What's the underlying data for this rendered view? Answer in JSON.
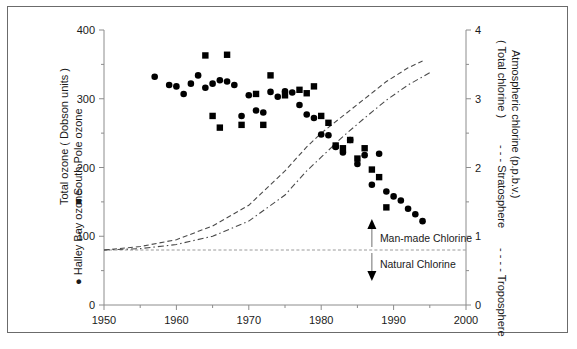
{
  "figure": {
    "background_color": "#ffffff",
    "frame_color": "#6b6b6b",
    "marker_color": "#000000",
    "curve_color": "#4a4a4a",
    "axis_color": "#8c8c8c"
  },
  "left_axis": {
    "title": "Total ozone ( Dobson units )",
    "legend_square": "South Pole ozone",
    "legend_circle": "Halley Bay ozone",
    "square_glyph": "■",
    "circle_glyph": "●",
    "ticks": [
      "0",
      "100",
      "200",
      "300",
      "400"
    ],
    "range": [
      0,
      400
    ]
  },
  "right_axis": {
    "title": "Atmospheric chlorine (p.p.b.v.)",
    "legend_total": "( Total chlorine )",
    "legend_strat": "- - -  Stratosphere",
    "legend_trop": "- - - -  Troposphere",
    "ticks": [
      "0",
      "1",
      "2",
      "3",
      "4"
    ],
    "range": [
      0,
      4
    ]
  },
  "x_axis": {
    "ticks": [
      "1950",
      "1960",
      "1970",
      "1980",
      "1990",
      "2000"
    ],
    "range": [
      1950,
      2000
    ],
    "minor_step": 5
  },
  "annotations": {
    "manmade": "Man-made Chlorine",
    "natural": "Natural Chlorine",
    "baseline_value": 0.8,
    "arrow_year": 1987
  },
  "chart_data": {
    "type": "scatter",
    "title": "",
    "xlabel": "",
    "ylabel": "Total ozone ( Dobson units )",
    "y2label": "Atmospheric chlorine (p.p.b.v.)",
    "xlim": [
      1950,
      2000
    ],
    "ylim": [
      0,
      400
    ],
    "y2lim": [
      0,
      4
    ],
    "grid": false,
    "legend_position": "axis-titles",
    "series": [
      {
        "name": "Halley Bay ozone",
        "marker": "circle",
        "axis": "left",
        "points": [
          [
            1957,
            332
          ],
          [
            1959,
            320
          ],
          [
            1960,
            318
          ],
          [
            1961,
            307
          ],
          [
            1962,
            322
          ],
          [
            1963,
            334
          ],
          [
            1964,
            316
          ],
          [
            1965,
            322
          ],
          [
            1966,
            327
          ],
          [
            1967,
            325
          ],
          [
            1968,
            320
          ],
          [
            1969,
            275
          ],
          [
            1970,
            305
          ],
          [
            1971,
            283
          ],
          [
            1972,
            280
          ],
          [
            1973,
            310
          ],
          [
            1974,
            303
          ],
          [
            1975,
            311
          ],
          [
            1976,
            309
          ],
          [
            1977,
            291
          ],
          [
            1978,
            277
          ],
          [
            1979,
            272
          ],
          [
            1980,
            248
          ],
          [
            1981,
            247
          ],
          [
            1982,
            230
          ],
          [
            1983,
            222
          ],
          [
            1984,
            240
          ],
          [
            1985,
            205
          ],
          [
            1986,
            218
          ],
          [
            1987,
            175
          ],
          [
            1988,
            220
          ],
          [
            1989,
            165
          ],
          [
            1990,
            158
          ],
          [
            1991,
            152
          ],
          [
            1992,
            140
          ],
          [
            1993,
            132
          ],
          [
            1994,
            122
          ]
        ]
      },
      {
        "name": "South Pole ozone",
        "marker": "square",
        "axis": "left",
        "points": [
          [
            1964,
            363
          ],
          [
            1967,
            364
          ],
          [
            1965,
            275
          ],
          [
            1966,
            258
          ],
          [
            1969,
            262
          ],
          [
            1971,
            307
          ],
          [
            1972,
            262
          ],
          [
            1973,
            334
          ],
          [
            1975,
            305
          ],
          [
            1977,
            313
          ],
          [
            1978,
            308
          ],
          [
            1979,
            318
          ],
          [
            1980,
            275
          ],
          [
            1981,
            265
          ],
          [
            1982,
            232
          ],
          [
            1983,
            228
          ],
          [
            1984,
            240
          ],
          [
            1985,
            213
          ],
          [
            1986,
            228
          ],
          [
            1987,
            197
          ],
          [
            1988,
            186
          ],
          [
            1989,
            142
          ]
        ]
      },
      {
        "name": "Troposphere",
        "marker": "dashed-line",
        "axis": "right",
        "points": [
          [
            1950,
            0.8
          ],
          [
            1955,
            0.85
          ],
          [
            1960,
            0.95
          ],
          [
            1965,
            1.15
          ],
          [
            1970,
            1.45
          ],
          [
            1975,
            1.95
          ],
          [
            1978,
            2.3
          ],
          [
            1980,
            2.5
          ],
          [
            1983,
            2.75
          ],
          [
            1986,
            3.0
          ],
          [
            1989,
            3.25
          ],
          [
            1992,
            3.45
          ],
          [
            1994,
            3.55
          ]
        ]
      },
      {
        "name": "Stratosphere",
        "marker": "dash-dot-line",
        "axis": "right",
        "points": [
          [
            1950,
            0.8
          ],
          [
            1955,
            0.82
          ],
          [
            1960,
            0.88
          ],
          [
            1965,
            1.0
          ],
          [
            1970,
            1.22
          ],
          [
            1975,
            1.6
          ],
          [
            1978,
            1.95
          ],
          [
            1980,
            2.15
          ],
          [
            1983,
            2.45
          ],
          [
            1986,
            2.72
          ],
          [
            1989,
            2.98
          ],
          [
            1992,
            3.2
          ],
          [
            1995,
            3.38
          ]
        ]
      },
      {
        "name": "Natural chlorine baseline",
        "marker": "dotted-line",
        "axis": "right",
        "points": [
          [
            1950,
            0.8
          ],
          [
            2000,
            0.8
          ]
        ]
      }
    ]
  }
}
